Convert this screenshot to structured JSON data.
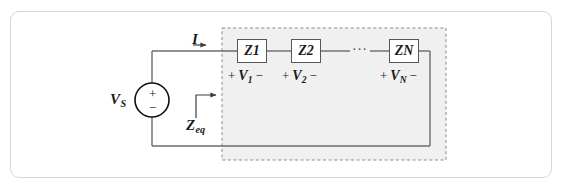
{
  "figure": {
    "kind": "circuit-diagram",
    "width": 562,
    "height": 191
  },
  "colors": {
    "background": "#ffffff",
    "frame_border": "#d6d6d6",
    "wire": "#6b6b6b",
    "component_border": "#575757",
    "shaded_region_fill": "#f0f0f0",
    "dashed_boundary": "#8a8a8a",
    "text": "#1a1a1a"
  },
  "source": {
    "label": "V",
    "label_subscript": "S",
    "terminal_plus": "+",
    "terminal_minus": "−",
    "symbol": "voltage-source-circle"
  },
  "current": {
    "label": "I",
    "arrow_direction": "right"
  },
  "equivalent": {
    "label": "Z",
    "label_subscript": "eq",
    "arrow_direction": "right"
  },
  "impedances": [
    {
      "name": "Z",
      "subscript": "1",
      "voltage_name": "V",
      "voltage_subscript": "1",
      "polarity_left": "+",
      "polarity_right": "−"
    },
    {
      "name": "Z",
      "subscript": "2",
      "voltage_name": "V",
      "voltage_subscript": "2",
      "polarity_left": "+",
      "polarity_right": "−"
    },
    {
      "name": "Z",
      "subscript": "N",
      "voltage_name": "V",
      "voltage_subscript": "N",
      "polarity_left": "+",
      "polarity_right": "−"
    }
  ],
  "ellipsis": "···"
}
